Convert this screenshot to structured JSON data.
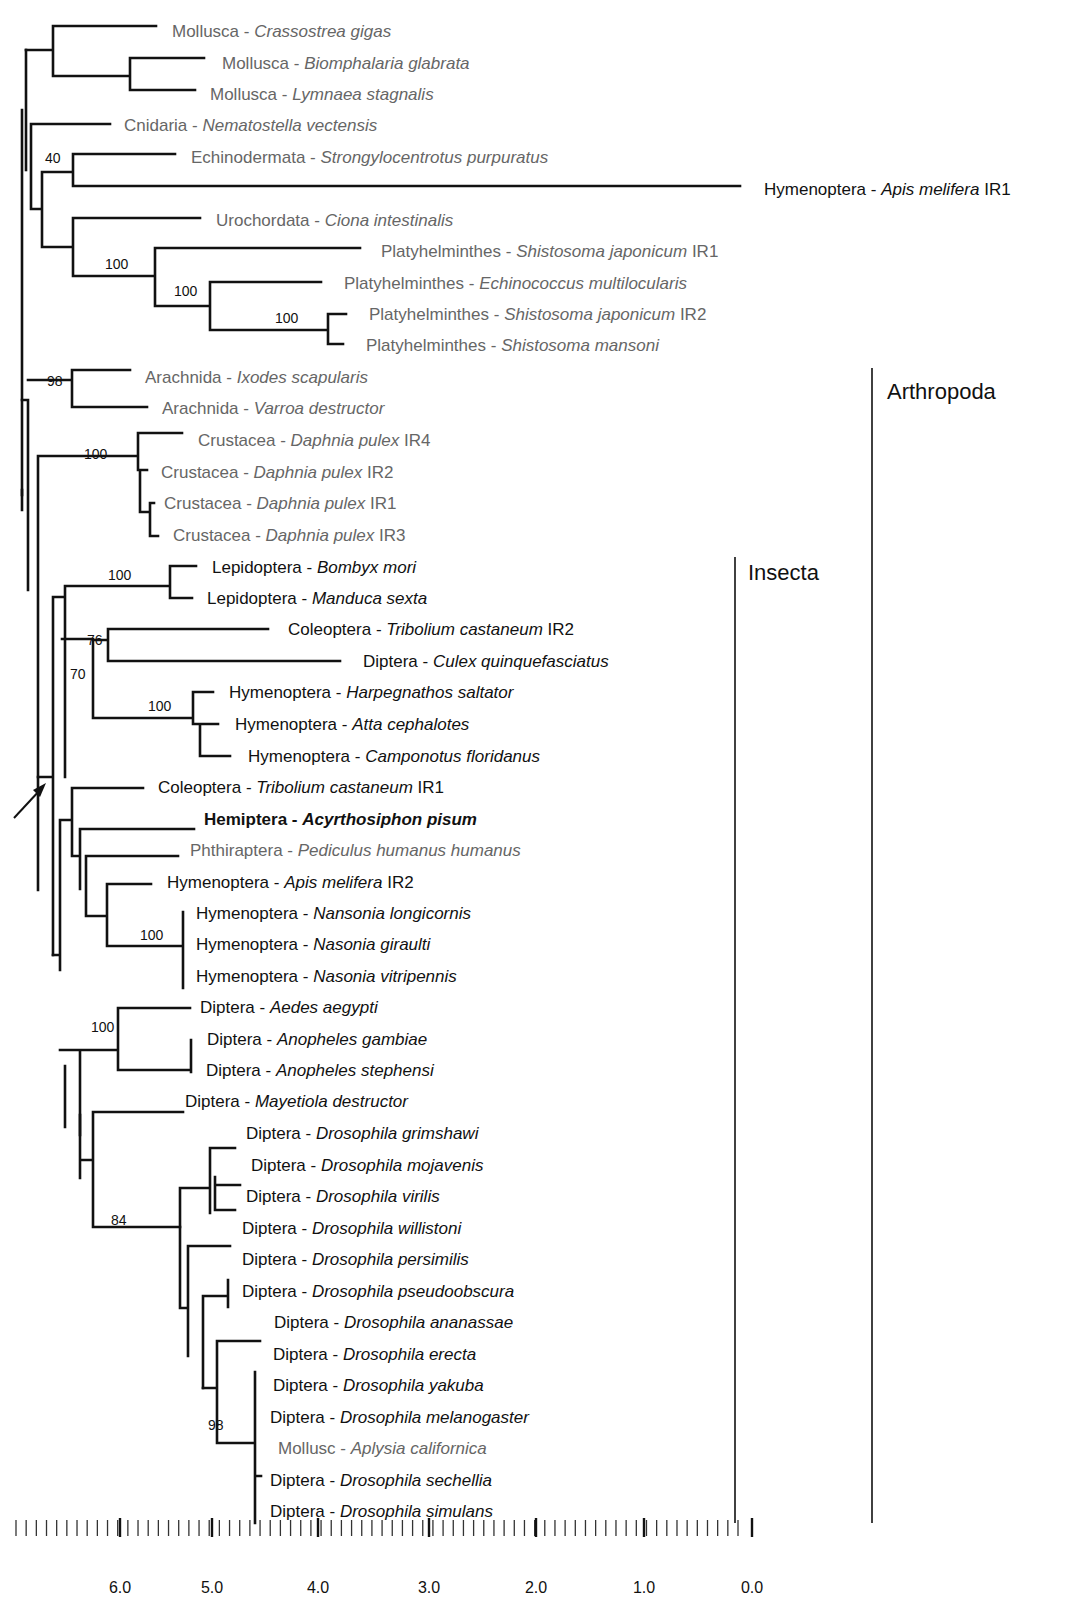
{
  "figure": {
    "type": "phylogenetic-tree",
    "clades": [
      {
        "label": "Arthropoda",
        "x": 872,
        "y1": 368,
        "y2": 1523,
        "label_x": 887,
        "label_y": 399
      },
      {
        "label": "Insecta",
        "x": 735,
        "y1": 557,
        "y2": 1523,
        "label_x": 748,
        "label_y": 580
      }
    ],
    "leaves": [
      {
        "group": "Mollusca",
        "species": "Crassostrea gigas",
        "suffix": "",
        "x": 172,
        "y": 31,
        "tone": "grey"
      },
      {
        "group": "Mollusca",
        "species": "Biomphalaria glabrata",
        "suffix": "",
        "x": 222,
        "y": 63,
        "tone": "grey"
      },
      {
        "group": "Mollusca",
        "species": "Lymnaea stagnalis",
        "suffix": "",
        "x": 210,
        "y": 94,
        "tone": "grey"
      },
      {
        "group": "Cnidaria",
        "species": "Nematostella vectensis",
        "suffix": "",
        "x": 124,
        "y": 125,
        "tone": "grey"
      },
      {
        "group": "Echinodermata",
        "species": "Strongylocentrotus purpuratus",
        "suffix": "",
        "x": 191,
        "y": 157,
        "tone": "grey"
      },
      {
        "group": "Hymenoptera",
        "species": "Apis melifera",
        "suffix": "IR1",
        "x": 764,
        "y": 189,
        "tone": "dark"
      },
      {
        "group": "Urochordata",
        "species": "Ciona intestinalis",
        "suffix": "",
        "x": 216,
        "y": 220,
        "tone": "grey"
      },
      {
        "group": "Platyhelminthes",
        "species": "Shistosoma japonicum",
        "suffix": "IR1",
        "x": 381,
        "y": 251,
        "tone": "grey"
      },
      {
        "group": "Platyhelminthes",
        "species": "Echinococcus multilocularis",
        "suffix": "",
        "x": 344,
        "y": 283,
        "tone": "grey"
      },
      {
        "group": "Platyhelminthes",
        "species": "Shistosoma japonicum",
        "suffix": "IR2",
        "x": 369,
        "y": 314,
        "tone": "grey"
      },
      {
        "group": "Platyhelminthes",
        "species": "Shistosoma mansoni",
        "suffix": "",
        "x": 366,
        "y": 345,
        "tone": "grey"
      },
      {
        "group": "Arachnida",
        "species": "Ixodes scapularis",
        "suffix": "",
        "x": 145,
        "y": 377,
        "tone": "grey"
      },
      {
        "group": "Arachnida",
        "species": "Varroa destructor",
        "suffix": "",
        "x": 162,
        "y": 408,
        "tone": "grey"
      },
      {
        "group": "Crustacea",
        "species": "Daphnia pulex",
        "suffix": "IR4",
        "x": 198,
        "y": 440,
        "tone": "grey"
      },
      {
        "group": "Crustacea",
        "species": "Daphnia pulex",
        "suffix": "IR2",
        "x": 161,
        "y": 472,
        "tone": "grey"
      },
      {
        "group": "Crustacea",
        "species": "Daphnia pulex",
        "suffix": "IR1",
        "x": 164,
        "y": 503,
        "tone": "grey"
      },
      {
        "group": "Crustacea",
        "species": "Daphnia pulex",
        "suffix": "IR3",
        "x": 173,
        "y": 535,
        "tone": "grey"
      },
      {
        "group": "Lepidoptera",
        "species": "Bombyx mori",
        "suffix": "",
        "x": 212,
        "y": 567,
        "tone": "dark"
      },
      {
        "group": "Lepidoptera",
        "species": "Manduca sexta",
        "suffix": "",
        "x": 207,
        "y": 598,
        "tone": "dark"
      },
      {
        "group": "Coleoptera",
        "species": "Tribolium castaneum",
        "suffix": "IR2",
        "x": 288,
        "y": 629,
        "tone": "dark"
      },
      {
        "group": "Diptera",
        "species": "Culex quinquefasciatus",
        "suffix": "",
        "x": 363,
        "y": 661,
        "tone": "dark"
      },
      {
        "group": "Hymenoptera",
        "species": "Harpegnathos saltator",
        "suffix": "",
        "x": 229,
        "y": 692,
        "tone": "dark"
      },
      {
        "group": "Hymenoptera",
        "species": "Atta cephalotes",
        "suffix": "",
        "x": 235,
        "y": 724,
        "tone": "dark"
      },
      {
        "group": "Hymenoptera",
        "species": "Camponotus floridanus",
        "suffix": "",
        "x": 248,
        "y": 756,
        "tone": "dark"
      },
      {
        "group": "Coleoptera",
        "species": "Tribolium castaneum",
        "suffix": "IR1",
        "x": 158,
        "y": 787,
        "tone": "dark"
      },
      {
        "group": "Hemiptera",
        "species": "Acyrthosiphon pisum",
        "suffix": "",
        "x": 204,
        "y": 819,
        "tone": "bold"
      },
      {
        "group": "Phthiraptera",
        "species": "Pediculus humanus humanus",
        "suffix": "",
        "x": 190,
        "y": 850,
        "tone": "grey"
      },
      {
        "group": "Hymenoptera",
        "species": "Apis melifera",
        "suffix": "IR2",
        "x": 167,
        "y": 882,
        "tone": "dark"
      },
      {
        "group": "Hymenoptera",
        "species": "Nansonia longicornis",
        "suffix": "",
        "x": 196,
        "y": 913,
        "tone": "dark"
      },
      {
        "group": "Hymenoptera",
        "species": "Nasonia giraulti",
        "suffix": "",
        "x": 196,
        "y": 944,
        "tone": "dark"
      },
      {
        "group": "Hymenoptera",
        "species": "Nasonia vitripennis",
        "suffix": "",
        "x": 196,
        "y": 976,
        "tone": "dark"
      },
      {
        "group": "Diptera",
        "species": "Aedes aegypti",
        "suffix": "",
        "x": 200,
        "y": 1007,
        "tone": "dark"
      },
      {
        "group": "Diptera",
        "species": "Anopheles gambiae",
        "suffix": "",
        "x": 207,
        "y": 1039,
        "tone": "dark"
      },
      {
        "group": "Diptera",
        "species": "Anopheles stephensi",
        "suffix": "",
        "x": 206,
        "y": 1070,
        "tone": "dark"
      },
      {
        "group": "Diptera",
        "species": "Mayetiola destructor",
        "suffix": "",
        "x": 185,
        "y": 1101,
        "tone": "dark"
      },
      {
        "group": "Diptera",
        "species": "Drosophila grimshawi",
        "suffix": "",
        "x": 246,
        "y": 1133,
        "tone": "dark"
      },
      {
        "group": "Diptera",
        "species": "Drosophila mojavenis",
        "suffix": "",
        "x": 251,
        "y": 1165,
        "tone": "dark"
      },
      {
        "group": "Diptera",
        "species": "Drosophila virilis",
        "suffix": "",
        "x": 246,
        "y": 1196,
        "tone": "dark"
      },
      {
        "group": "Diptera",
        "species": "Drosophila willistoni",
        "suffix": "",
        "x": 242,
        "y": 1228,
        "tone": "dark"
      },
      {
        "group": "Diptera",
        "species": "Drosophila persimilis",
        "suffix": "",
        "x": 242,
        "y": 1259,
        "tone": "dark"
      },
      {
        "group": "Diptera",
        "species": "Drosophila pseudoobscura",
        "suffix": "",
        "x": 242,
        "y": 1291,
        "tone": "dark"
      },
      {
        "group": "Diptera",
        "species": "Drosophila ananassae",
        "suffix": "",
        "x": 274,
        "y": 1322,
        "tone": "dark"
      },
      {
        "group": "Diptera",
        "species": "Drosophila erecta",
        "suffix": "",
        "x": 273,
        "y": 1354,
        "tone": "dark"
      },
      {
        "group": "Diptera",
        "species": "Drosophila yakuba",
        "suffix": "",
        "x": 273,
        "y": 1385,
        "tone": "dark"
      },
      {
        "group": "Diptera",
        "species": "Drosophila melanogaster",
        "suffix": "",
        "x": 270,
        "y": 1417,
        "tone": "dark"
      },
      {
        "group": "Mollusc",
        "species": "Aplysia californica",
        "suffix": "",
        "x": 278,
        "y": 1448,
        "tone": "grey"
      },
      {
        "group": "Diptera",
        "species": "Drosophila sechellia",
        "suffix": "",
        "x": 270,
        "y": 1480,
        "tone": "dark"
      },
      {
        "group": "Diptera",
        "species": "Drosophila simulans",
        "suffix": "",
        "x": 270,
        "y": 1511,
        "tone": "dark"
      }
    ],
    "bootstrap": [
      {
        "value": "40",
        "x": 45,
        "y": 163
      },
      {
        "value": "100",
        "x": 105,
        "y": 269
      },
      {
        "value": "100",
        "x": 174,
        "y": 296
      },
      {
        "value": "100",
        "x": 275,
        "y": 323
      },
      {
        "value": "98",
        "x": 47,
        "y": 386
      },
      {
        "value": "100",
        "x": 84,
        "y": 459
      },
      {
        "value": "100",
        "x": 108,
        "y": 580
      },
      {
        "value": "76",
        "x": 87,
        "y": 645
      },
      {
        "value": "70",
        "x": 70,
        "y": 679
      },
      {
        "value": "100",
        "x": 148,
        "y": 711
      },
      {
        "value": "100",
        "x": 140,
        "y": 940
      },
      {
        "value": "100",
        "x": 91,
        "y": 1032
      },
      {
        "value": "84",
        "x": 111,
        "y": 1225
      },
      {
        "value": "98",
        "x": 208,
        "y": 1430
      }
    ],
    "scale": {
      "ticks": [
        "6.0",
        "5.0",
        "4.0",
        "3.0",
        "2.0",
        "1.0",
        "0.0"
      ],
      "tick_x": [
        62,
        137,
        212,
        287,
        362,
        437,
        512
      ],
      "label_y": 1605,
      "bar_y1": 1477,
      "bar_y2": 1495,
      "x_start": 16,
      "x_end": 499,
      "minor_count": 71
    },
    "arrow": {
      "x1": 16,
      "y1": 846,
      "x2": 46,
      "y2": 820
    }
  }
}
